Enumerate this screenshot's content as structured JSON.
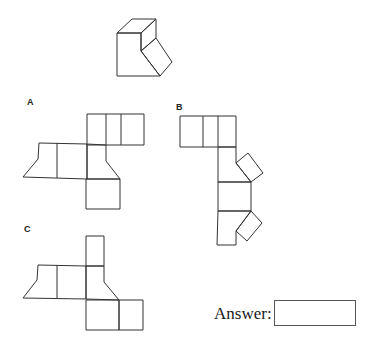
{
  "puzzle": {
    "type": "cube-net-selection",
    "options": [
      {
        "label": "A"
      },
      {
        "label": "B"
      },
      {
        "label": "C"
      }
    ],
    "answer": {
      "label": "Answer:",
      "value": ""
    }
  }
}
